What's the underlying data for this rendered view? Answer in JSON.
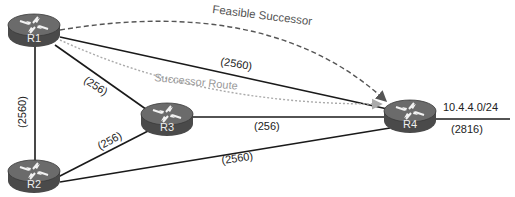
{
  "diagram": {
    "type": "network-topology",
    "routers": [
      {
        "id": "R1",
        "label": "R1"
      },
      {
        "id": "R2",
        "label": "R2"
      },
      {
        "id": "R3",
        "label": "R3"
      },
      {
        "id": "R4",
        "label": "R4"
      }
    ],
    "links": [
      {
        "from": "R1",
        "to": "R2",
        "metric": "(2560)"
      },
      {
        "from": "R1",
        "to": "R3",
        "metric": "(256)"
      },
      {
        "from": "R1",
        "to": "R4",
        "metric": "(2560)"
      },
      {
        "from": "R2",
        "to": "R3",
        "metric": "(256)"
      },
      {
        "from": "R3",
        "to": "R4",
        "metric": "(256)"
      },
      {
        "from": "R2",
        "to": "R4",
        "metric": "(2560)"
      },
      {
        "from": "R4",
        "to": "network",
        "metric": "(2816)"
      }
    ],
    "network": {
      "prefix": "10.4.4.0/24",
      "metric": "(2816)"
    },
    "paths": {
      "feasible_successor": "Feasible Successor",
      "successor_route": "Successor Route"
    }
  },
  "colors": {
    "line": "#1a1a1a",
    "router_body": "#555555",
    "router_top": "#6e6e6e",
    "feasible_path": "#555555",
    "successor_path": "#a8a8a8"
  }
}
